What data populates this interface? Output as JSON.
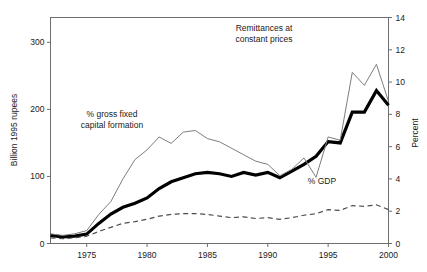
{
  "chart_data": {
    "type": "line",
    "title": "",
    "xlabel": "",
    "ylabel": "Billion 1995 rupees",
    "y2label": "Percent",
    "xlim": [
      1972,
      2000
    ],
    "ylim": [
      0,
      337
    ],
    "y2lim": [
      0,
      14
    ],
    "grid": false,
    "legend_position": "inline-annotations",
    "x_ticks": [
      "1975",
      "1980",
      "1985",
      "1990",
      "1995",
      "2000"
    ],
    "x_tick_values": [
      1975,
      1980,
      1985,
      1990,
      1995,
      2000
    ],
    "y_ticks": [
      "0",
      "100",
      "200",
      "300"
    ],
    "y_tick_values": [
      0,
      100,
      200,
      300
    ],
    "y2_ticks": [
      "0",
      "2",
      "4",
      "6",
      "8",
      "10",
      "12",
      "14"
    ],
    "y2_tick_values": [
      0,
      2,
      4,
      6,
      8,
      10,
      12,
      14
    ],
    "x": [
      1972,
      1973,
      1974,
      1975,
      1976,
      1977,
      1978,
      1979,
      1980,
      1981,
      1982,
      1983,
      1984,
      1985,
      1986,
      1987,
      1988,
      1989,
      1990,
      1991,
      1992,
      1993,
      1994,
      1995,
      1996,
      1997,
      1998,
      1999,
      2000
    ],
    "series": [
      {
        "name": "Remittances at constant prices",
        "axis": "left",
        "style": "solid-thick",
        "color": "#000000",
        "width": 3.2,
        "values": [
          12,
          10,
          11,
          14,
          30,
          44,
          54,
          60,
          68,
          82,
          92,
          98,
          104,
          106,
          104,
          100,
          106,
          102,
          106,
          98,
          108,
          118,
          130,
          152,
          150,
          196,
          196,
          228,
          206
        ]
      },
      {
        "name": "% gross fixed capital formation",
        "axis": "right",
        "style": "solid-thin",
        "color": "#7d7d7d",
        "width": 1,
        "values": [
          0.6,
          0.5,
          0.6,
          0.8,
          1.8,
          2.6,
          4.0,
          5.2,
          5.8,
          6.6,
          6.2,
          6.9,
          7.0,
          6.5,
          6.3,
          5.9,
          5.5,
          5.1,
          4.9,
          4.2,
          4.6,
          5.3,
          4.1,
          6.6,
          6.4,
          10.6,
          9.8,
          11.1,
          8.8
        ]
      },
      {
        "name": "% GDP",
        "axis": "right",
        "style": "dashed",
        "color": "#4d4d4d",
        "width": 1.2,
        "values": [
          0.35,
          0.3,
          0.35,
          0.45,
          0.75,
          1.0,
          1.25,
          1.35,
          1.5,
          1.7,
          1.8,
          1.85,
          1.85,
          1.8,
          1.7,
          1.6,
          1.65,
          1.55,
          1.6,
          1.5,
          1.6,
          1.75,
          1.85,
          2.1,
          2.05,
          2.35,
          2.3,
          2.4,
          2.1
        ]
      }
    ],
    "annotations": [
      {
        "text": "Remittances at constant prices",
        "line1": "Remittances at",
        "line2": "constant prices",
        "x": 264,
        "y": 31
      },
      {
        "text": "% gross fixed capital formation",
        "line1": "% gross fixed",
        "line2": "capital formation",
        "x": 112,
        "y": 117
      },
      {
        "text": "% GDP",
        "line1": "% GDP",
        "line2": "",
        "x": 322,
        "y": 184
      }
    ]
  }
}
